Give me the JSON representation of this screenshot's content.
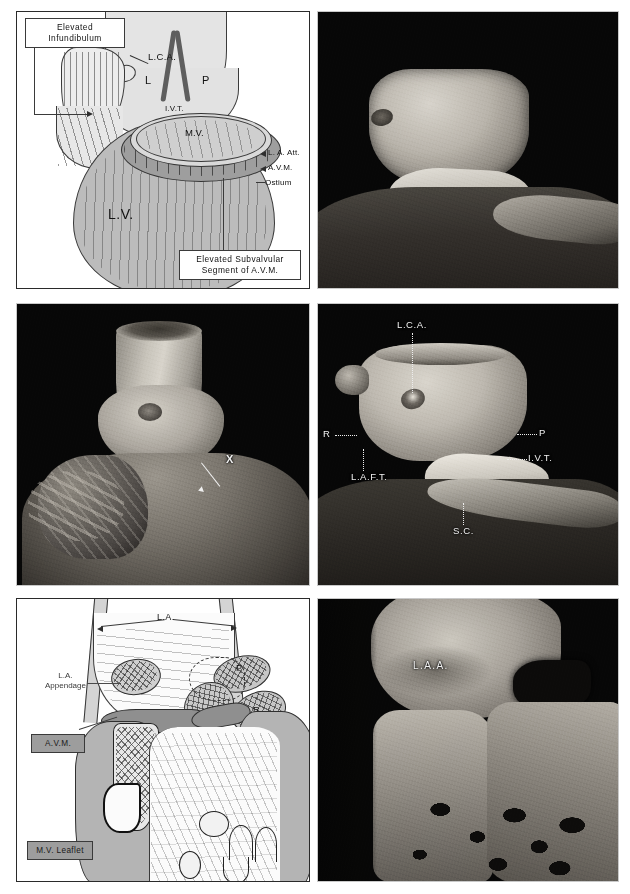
{
  "figure": {
    "layout": {
      "rows": 3,
      "columns": 2,
      "gutter_px": 4,
      "background": "#ffffff"
    },
    "colors": {
      "photo_background": "#070707",
      "diagram_background": "#ffffff",
      "ink": "#2a2a2a",
      "grey_box_fill": "#9d9d9d",
      "muscle_fill": "#bcbcbc",
      "ring_fill": "#9a9a9a"
    }
  },
  "panels": [
    {
      "id": "top-left",
      "type": "line-drawing",
      "caption": "",
      "labels": [
        {
          "key": "elevated-infundibulum",
          "text": "Elevated\nInfundibulum",
          "style": "boxed"
        },
        {
          "key": "lca",
          "text": "L.C.A.",
          "style": "plain"
        },
        {
          "key": "l",
          "text": "L",
          "style": "plain"
        },
        {
          "key": "p",
          "text": "P",
          "style": "plain"
        },
        {
          "key": "ivt",
          "text": "I.V.T.",
          "style": "plain"
        },
        {
          "key": "mv",
          "text": "M.V.",
          "style": "plain"
        },
        {
          "key": "la-att",
          "text": "L. A. Att.",
          "style": "arrow"
        },
        {
          "key": "avm",
          "text": "A.V.M.",
          "style": "arrow"
        },
        {
          "key": "ostium",
          "text": "Ostium",
          "style": "plain"
        },
        {
          "key": "lv",
          "text": "L.V.",
          "style": "plain"
        },
        {
          "key": "elevated-subvalvular",
          "text": "Elevated Subvalvular\nSegment of A.V.M.",
          "style": "boxed"
        }
      ],
      "boxed_label_lines": {
        "elevated_infundibulum": [
          "Elevated",
          "Infundibulum"
        ],
        "elevated_subvalvular": [
          "Elevated Subvalvular",
          "Segment of A.V.M."
        ]
      }
    },
    {
      "id": "top-right",
      "type": "photograph",
      "caption": "",
      "labels": []
    },
    {
      "id": "middle-left",
      "type": "photograph",
      "caption": "",
      "labels": [
        {
          "key": "x",
          "text": "X",
          "style": "arrow"
        }
      ]
    },
    {
      "id": "middle-right",
      "type": "photograph",
      "caption": "",
      "labels": [
        {
          "key": "lca",
          "text": "L.C.A.",
          "style": "leader"
        },
        {
          "key": "r",
          "text": "R",
          "style": "leader"
        },
        {
          "key": "p",
          "text": "P",
          "style": "leader"
        },
        {
          "key": "ivt",
          "text": "I.V.T.",
          "style": "leader"
        },
        {
          "key": "laft",
          "text": "L.A.F.T.",
          "style": "leader"
        },
        {
          "key": "sc",
          "text": "S.C.",
          "style": "leader"
        }
      ]
    },
    {
      "id": "bottom-left",
      "type": "line-drawing",
      "caption": "",
      "labels": [
        {
          "key": "la",
          "text": "L.A.",
          "style": "double-arrow"
        },
        {
          "key": "la-appendage",
          "text": "L.A.\nAppendage",
          "style": "leader"
        },
        {
          "key": "avm",
          "text": "A.V.M.",
          "style": "grey-box"
        },
        {
          "key": "mv-leaflet",
          "text": "M.V. Leaflet",
          "style": "grey-box"
        },
        {
          "key": "p",
          "text": "P",
          "style": "plain"
        },
        {
          "key": "r",
          "text": "R",
          "style": "plain"
        }
      ],
      "multiline_labels": {
        "la_appendage": [
          "L.A.",
          "Appendage"
        ]
      }
    },
    {
      "id": "bottom-right",
      "type": "photograph",
      "caption": "",
      "labels": [
        {
          "key": "laa",
          "text": "L.A.A.",
          "style": "plain"
        }
      ]
    }
  ],
  "abbreviations": {
    "LCA": "L.C.A.",
    "LV": "L.V.",
    "LA": "L.A.",
    "LAA": "L.A.A.",
    "MV": "M.V.",
    "AVM": "A.V.M.",
    "IVT": "I.V.T.",
    "LAFT": "L.A.F.T.",
    "SC": "S.C.",
    "P": "P",
    "L": "L",
    "R": "R",
    "X": "X",
    "Ostium": "Ostium",
    "LAAtt": "L. A. Att.",
    "MVLeaflet": "M.V. Leaflet",
    "LAAppendageLine1": "L.A.",
    "LAAppendageLine2": "Appendage",
    "ElevatedLine1": "Elevated",
    "ElevatedLine2": "Infundibulum",
    "SubvalvLine1": "Elevated Subvalvular",
    "SubvalvLine2": "Segment of A.V.M."
  }
}
